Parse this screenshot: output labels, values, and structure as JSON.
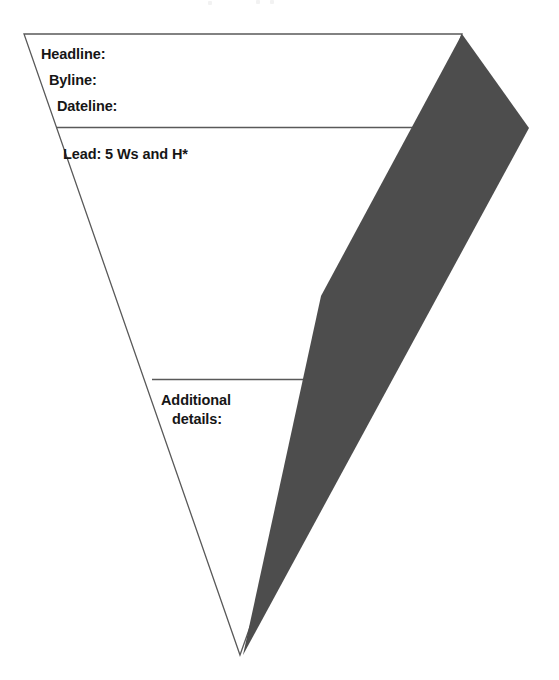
{
  "diagram": {
    "type": "inverted-pyramid",
    "background_color": "#ffffff",
    "outline_color": "#595959",
    "arrow_color": "#4d4d4d",
    "text_color": "#161616",
    "sections": [
      {
        "id": "top-section",
        "name": "most-newsworthy-info",
        "labels": [
          {
            "id": "headline",
            "text": "Headline:"
          },
          {
            "id": "byline",
            "text": "Byline:"
          },
          {
            "id": "dateline",
            "text": "Dateline:"
          }
        ]
      },
      {
        "id": "middle-section",
        "name": "lead-section",
        "labels": [
          {
            "id": "lead",
            "text": "Lead: 5 Ws and H*"
          }
        ]
      },
      {
        "id": "bottom-section",
        "name": "additional-details-section",
        "labels": [
          {
            "id": "additional",
            "line1": "Additional",
            "line2": "details:"
          }
        ]
      }
    ],
    "geometry": {
      "pyramid_points": "24,34 462,34 240,655",
      "divider_1_y": 128,
      "divider_2_y": 380,
      "arrow_points": "462,34 528,128 243,654 318,300"
    }
  }
}
